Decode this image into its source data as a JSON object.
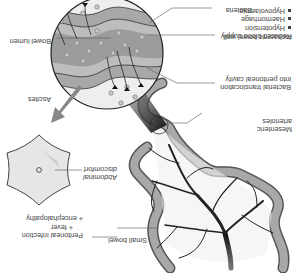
{
  "diagram": {
    "orientation": "rotated-180",
    "labels": {
      "reduced_blood_supply": {
        "title": "Reduced blood supply",
        "bullets": [
          "Hypotension",
          "Haemorrhage",
          "Hypovolaemia"
        ]
      },
      "small_bowel": "Small bowel",
      "mesenteric_arterioles": [
        "Mesenteric",
        "arterioles"
      ],
      "bowel_lumen": "Bowel lumen",
      "bacterial_translocation": [
        "Bacterial translocation",
        "into peritoneal cavity"
      ],
      "ischaemic_bowel_wall": "Ischaemic bowel wall",
      "bacteria": "Bacteria",
      "ascites": "Ascites",
      "abdominal_discomfort": [
        "Abdominal",
        "discomfort"
      ],
      "peritoneal_infection": [
        "Peritoneal infection",
        "+ fever",
        "+ encephalopathy"
      ]
    },
    "colors": {
      "bowel_wall": "#a8a8a8",
      "bowel_outline": "#555555",
      "lumen": "#bdbdbd",
      "lumen_dark": "#8e8e8e",
      "peritoneal": "#eeeeee",
      "bacteria_fill": "#c9c9c9",
      "vessel": "#222222",
      "arrow": "#888888",
      "abdomen_fill": "#e6e6e6",
      "text": "#444444"
    }
  }
}
